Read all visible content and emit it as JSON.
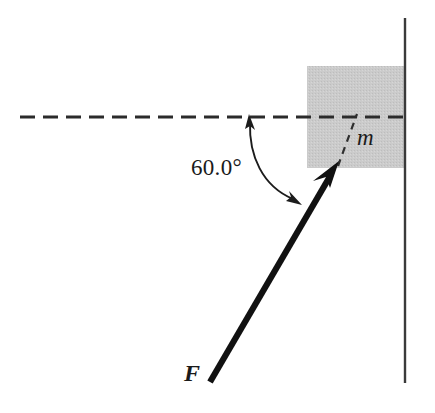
{
  "figure": {
    "name": "force-on-block-against-wall-diagram",
    "canvas": {
      "width": 435,
      "height": 413,
      "background": "#ffffff"
    },
    "labels": {
      "angle": "60.0°",
      "mass": "m",
      "force": "F"
    },
    "colors": {
      "block_fill": "#c9c9c9",
      "block_edge": "#c9c9c9",
      "line": "#1a1a1a",
      "wall": "#3a3a3a",
      "dash": "#2b2b2b",
      "background": "#ffffff"
    },
    "elements": {
      "wall": {
        "name": "vertical-wall-line",
        "x": 405,
        "y_top": 18,
        "y_bottom": 383,
        "stroke_width": 2.4
      },
      "block": {
        "name": "mass-block",
        "x": 307,
        "y": 66,
        "width": 98,
        "height": 102
      },
      "horizontal_dashed_line": {
        "name": "horizontal-reference-line",
        "x_start": 20,
        "x_end": 405,
        "y": 117,
        "dash": "15 8",
        "stroke_width": 3.2
      },
      "force_vector": {
        "name": "force-arrow",
        "tail_x": 210,
        "tail_y": 382,
        "tip_x": 338,
        "tip_y": 163,
        "stroke_width": 6,
        "angle_degrees": 60.0
      },
      "angle_arc": {
        "name": "angle-arc",
        "start_x": 249,
        "start_y": 118,
        "end_x": 300,
        "end_y": 203,
        "control_x": 252,
        "control_y": 185,
        "stroke_width": 1.8,
        "double_headed": true
      },
      "mass_leader": {
        "name": "mass-leader-dashed-line",
        "x_start": 338,
        "y_start": 164,
        "x_end": 357,
        "y_end": 116,
        "dash": "7 6",
        "stroke_width": 2.2
      }
    }
  }
}
